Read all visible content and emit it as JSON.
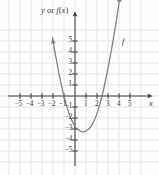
{
  "figure": {
    "type": "cartesian-graph",
    "background_color": "#fefefe",
    "grid_color": "#ededf0",
    "axis_color": "#3b3b3b",
    "curve_color": "#7d7d7d",
    "y_axis_label": "y or f(x)",
    "y_axis_label_parts": {
      "y": "y",
      "or": " or ",
      "f": "f",
      "open": "(",
      "x": "x",
      "close": ")"
    },
    "x_axis_label": "x",
    "curve_label": "f"
  },
  "axes": {
    "x_ticks": [
      "-5",
      "-4",
      "-3",
      "-2",
      "-1",
      "1",
      "2",
      "3",
      "4",
      "5"
    ],
    "y_ticks": [
      "5",
      "4",
      "3",
      "2",
      "1",
      "-1",
      "-2",
      "-3",
      "-4",
      "-5"
    ],
    "x_tick_values": [
      -5,
      -4,
      -3,
      -2,
      -1,
      1,
      2,
      3,
      4,
      5
    ],
    "y_tick_values": [
      5,
      4,
      3,
      2,
      1,
      -1,
      -2,
      -3,
      -4,
      -5
    ],
    "minus_glyph": "−"
  },
  "chart_data": {
    "type": "line",
    "title": "",
    "xlabel": "x",
    "ylabel": "y or f(x)",
    "xlim": [
      -6.6,
      6.8
    ],
    "ylim": [
      -6.6,
      6.4
    ],
    "grid": true,
    "legend": "none",
    "annotations": [
      {
        "text": "f",
        "x": 4.3,
        "y": 4.6
      },
      {
        "text": "y or f(x)",
        "x": -1.6,
        "y": 6.5
      },
      {
        "text": "x",
        "x": 6.4,
        "y": -0.7
      }
    ],
    "series": [
      {
        "name": "f",
        "equation": "y = x^2 - 2x - 3",
        "roots": [
          -1,
          3
        ],
        "vertex": [
          1,
          -3
        ],
        "y_intercept": -2.4,
        "arrows": [
          "start",
          "end"
        ],
        "x": [
          -2.05,
          -1.9,
          -1.75,
          -1.6,
          -1.45,
          -1.3,
          -1.15,
          -1.0,
          -0.85,
          -0.7,
          -0.55,
          -0.4,
          -0.25,
          -0.1,
          0.05,
          0.2,
          0.35,
          0.5,
          0.65,
          0.8,
          0.95,
          1.1,
          1.25,
          1.4,
          1.55,
          1.7,
          1.85,
          2.0,
          2.15,
          2.3,
          2.45,
          2.6,
          2.75,
          2.9,
          3.05,
          3.2,
          3.35,
          3.5,
          3.65,
          3.8,
          3.95,
          4.1
        ],
        "y": [
          5.3,
          4.4,
          3.6,
          2.8,
          2.0,
          1.3,
          0.6,
          0.0,
          -0.6,
          -1.1,
          -1.6,
          -2.0,
          -2.3,
          -2.6,
          -2.85,
          -3.0,
          -3.1,
          -3.2,
          -3.25,
          -3.25,
          -3.2,
          -3.1,
          -3.0,
          -2.85,
          -2.6,
          -2.3,
          -2.0,
          -1.6,
          -1.1,
          -0.6,
          0.0,
          0.6,
          1.3,
          2.0,
          2.8,
          3.6,
          4.4,
          5.3,
          6.2,
          7.1,
          8.1,
          9.1
        ]
      }
    ]
  }
}
